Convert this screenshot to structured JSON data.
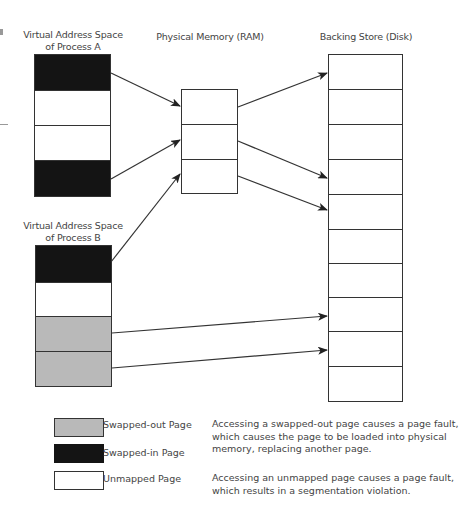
{
  "titles": {
    "process_a": [
      "Virtual Address Space",
      "of Process A"
    ],
    "process_b": [
      "Virtual Address Space",
      "of Process B"
    ],
    "ram": "Physical Memory (RAM)",
    "disk": "Backing Store (Disk)"
  },
  "process_a_pages": [
    "swapped-in",
    "unmapped",
    "unmapped",
    "swapped-in"
  ],
  "process_b_pages": [
    "swapped-in",
    "unmapped",
    "swapped-out",
    "swapped-out"
  ],
  "ram_frames": 3,
  "disk_blocks": 10,
  "mappings": [
    {
      "from": "process_a.page0",
      "to": "ram.frame0"
    },
    {
      "from": "process_a.page3",
      "to": "ram.frame1"
    },
    {
      "from": "process_b.page0",
      "to": "ram.frame2"
    },
    {
      "from": "ram.frame0",
      "to": "disk.block0"
    },
    {
      "from": "ram.frame1",
      "to": "disk.block3"
    },
    {
      "from": "ram.frame2",
      "to": "disk.block4"
    },
    {
      "from": "process_b.page2",
      "to": "disk.block7"
    },
    {
      "from": "process_b.page3",
      "to": "disk.block8"
    }
  ],
  "colors": {
    "swapped_in": "#141414",
    "swapped_out": "#b9b9b9",
    "unmapped": "#ffffff",
    "stroke": "#333333"
  },
  "legend": [
    {
      "kind": "swapped-out",
      "label": "Swapped-out Page"
    },
    {
      "kind": "swapped-in",
      "label": "Swapped-in Page"
    },
    {
      "kind": "unmapped",
      "label": "Unmapped Page"
    }
  ],
  "legend_notes": {
    "swapped_out": "Accessing a swapped-out page causes a page fault, which causes the page to be loaded into physical memory, replacing another page.",
    "unmapped": "Accessing an unmapped page causes a page fault, which results in a segmentation violation."
  }
}
